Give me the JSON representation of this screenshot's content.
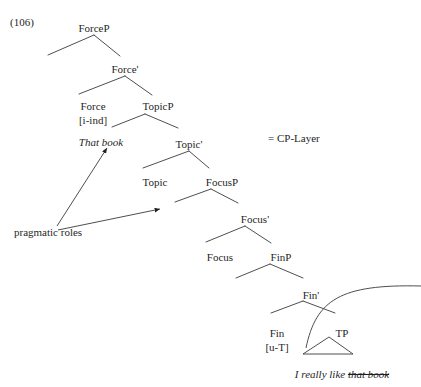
{
  "example": {
    "number": "(106)"
  },
  "annotations": {
    "cp_layer": "= CP-Layer",
    "pragmatic_roles": "pragmatic roles"
  },
  "tree": {
    "nodes": [
      {
        "id": "forceP",
        "label": "ForceP",
        "x": 94,
        "y": 22,
        "style": "plain"
      },
      {
        "id": "forceBar",
        "label": "Force'",
        "x": 125,
        "y": 63,
        "style": "plain"
      },
      {
        "id": "force",
        "label": "Force",
        "x": 93,
        "y": 100,
        "style": "plain"
      },
      {
        "id": "forceFeat",
        "label": "[i-ind]",
        "x": 93,
        "y": 114,
        "style": "plain"
      },
      {
        "id": "thatBook",
        "label": "That book",
        "x": 101,
        "y": 136,
        "style": "italic"
      },
      {
        "id": "topicP",
        "label": "TopicP",
        "x": 158,
        "y": 100,
        "style": "plain"
      },
      {
        "id": "topicBar",
        "label": "Topic'",
        "x": 189,
        "y": 138,
        "style": "plain"
      },
      {
        "id": "topic",
        "label": "Topic",
        "x": 155,
        "y": 176,
        "style": "plain"
      },
      {
        "id": "focusP",
        "label": "FocusP",
        "x": 222,
        "y": 176,
        "style": "plain"
      },
      {
        "id": "focusBar",
        "label": "Focus'",
        "x": 255,
        "y": 213,
        "style": "plain"
      },
      {
        "id": "focus",
        "label": "Focus",
        "x": 220,
        "y": 251,
        "style": "plain"
      },
      {
        "id": "finP",
        "label": "FinP",
        "x": 281,
        "y": 251,
        "style": "plain"
      },
      {
        "id": "finBar",
        "label": "Fin'",
        "x": 311,
        "y": 289,
        "style": "plain"
      },
      {
        "id": "fin",
        "label": "Fin",
        "x": 277,
        "y": 327,
        "style": "plain"
      },
      {
        "id": "finFeat",
        "label": "[u-T]",
        "x": 277,
        "y": 341,
        "style": "plain"
      },
      {
        "id": "tp",
        "label": "TP",
        "x": 342,
        "y": 327,
        "style": "plain"
      }
    ],
    "terminal_string": {
      "prefix": "I really like ",
      "struck": "that book",
      "x": 342,
      "y": 368
    },
    "branches": [
      {
        "from": "forceP",
        "apex": [
          94,
          35
        ],
        "left": [
          48,
          55
        ],
        "right": [
          120,
          56
        ]
      },
      {
        "from": "forceBar",
        "apex": [
          125,
          76
        ],
        "left": [
          79,
          94
        ],
        "right": [
          152,
          95
        ]
      },
      {
        "from": "topicP",
        "apex": [
          145,
          114
        ],
        "left": [
          112,
          127
        ],
        "right": [
          178,
          128
        ]
      },
      {
        "from": "topicBar",
        "apex": [
          189,
          151
        ],
        "left": [
          143,
          168
        ],
        "right": [
          209,
          168
        ]
      },
      {
        "from": "focusP",
        "apex": [
          211,
          189
        ],
        "left": [
          175,
          202
        ],
        "right": [
          238,
          203
        ]
      },
      {
        "from": "focusBar",
        "apex": [
          245,
          226
        ],
        "left": [
          206,
          242
        ],
        "right": [
          271,
          243
        ]
      },
      {
        "from": "finP",
        "apex": [
          270,
          264
        ],
        "left": [
          236,
          278
        ],
        "right": [
          303,
          278
        ]
      },
      {
        "from": "finBar",
        "apex": [
          303,
          301
        ],
        "left": [
          271,
          313
        ],
        "right": [
          335,
          313
        ]
      }
    ],
    "triangle": {
      "apex": [
        329,
        337
      ],
      "left": [
        303,
        354
      ],
      "right": [
        353,
        354
      ]
    },
    "movement_arc": {
      "start": [
        306,
        348
      ],
      "c1": [
        316,
        300
      ],
      "c2": [
        340,
        284
      ],
      "end": [
        421,
        286
      ]
    },
    "pragmatic_arrows": [
      {
        "from": [
          57,
          226
        ],
        "to": [
          107,
          148
        ]
      },
      {
        "from": [
          58,
          230
        ],
        "to": [
          160,
          209
        ]
      }
    ]
  }
}
